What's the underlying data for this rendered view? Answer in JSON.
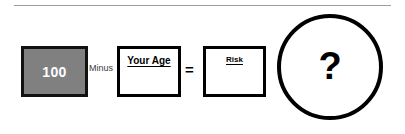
{
  "diagram": {
    "top_rule": true,
    "base_box": {
      "name": "base-value-box",
      "value": "100",
      "fill_color": "#808080",
      "text_color": "#ffffff"
    },
    "operator_minus": "Minus",
    "age_box": {
      "name": "your-age-box",
      "caption": "Your Age",
      "value": ""
    },
    "operator_equals": "=",
    "risk_box": {
      "name": "risk-box",
      "caption": "Risk",
      "value": ""
    },
    "result_circle": {
      "name": "question-circle",
      "glyph": "?"
    }
  }
}
